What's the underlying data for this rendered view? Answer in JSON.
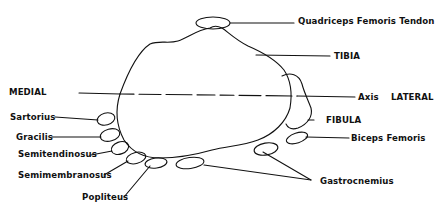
{
  "diagram": {
    "labels": {
      "quadriceps": "Quadriceps Femoris Tendon",
      "tibia": "TIBIA",
      "medial": "MEDIAL",
      "axis": "Axis",
      "lateral": "LATERAL",
      "fibula": "FIBULA",
      "sartorius": "Sartorius",
      "gracilis": "Gracilis",
      "semitendinosus": "Semitendinosus",
      "biceps_femoris": "Biceps Femoris",
      "semimembranosus": "Semimembranosus",
      "gastrocnemius": "Gastrocnemius",
      "popliteus": "Popliteus"
    },
    "colors": {
      "stroke": "#111111",
      "background": "#ffffff"
    }
  }
}
